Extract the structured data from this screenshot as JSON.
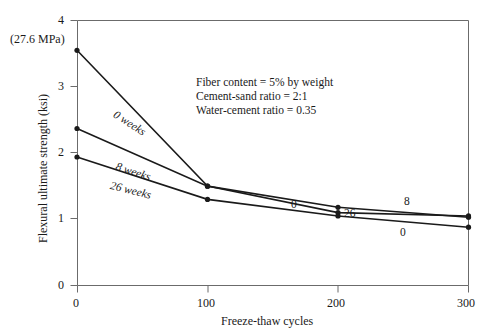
{
  "figure": {
    "background": "#ffffff",
    "line_color": "#1a1a1a",
    "axis_color": "#6b6b6b"
  },
  "annotations": {
    "mpa_note": "(27.6 MPa)",
    "conditions": [
      "Fiber content = 5% by weight",
      "Cement-sand ratio = 2:1",
      "Water-cement ratio = 0.35"
    ]
  },
  "curve_labels": [
    {
      "text": "0 weeks",
      "x": 118,
      "y": 108,
      "rot": 33
    },
    {
      "text": "8 weeks",
      "x": 118,
      "y": 160,
      "rot": 18
    },
    {
      "text": "26 weeks",
      "x": 112,
      "y": 179,
      "rot": 14
    }
  ],
  "end_labels": [
    {
      "text": "0",
      "x": 291,
      "y": 198
    },
    {
      "text": "26",
      "x": 344,
      "y": 207
    },
    {
      "text": "8",
      "x": 404,
      "y": 195
    },
    {
      "text": "0",
      "x": 400,
      "y": 226
    }
  ],
  "chart_data": {
    "type": "line",
    "title": "",
    "xlabel": "Freeze-thaw cycles",
    "ylabel": "Flexural ultimate strength (ksi)",
    "xlim": [
      0,
      300
    ],
    "ylim": [
      0,
      4
    ],
    "xticks": [
      0,
      100,
      200,
      300
    ],
    "yticks": [
      0,
      1,
      2,
      3,
      4
    ],
    "xtick_labels": [
      "0",
      "100",
      "200",
      "300"
    ],
    "ytick_labels": [
      "0",
      "1",
      "2",
      "3",
      "4"
    ],
    "grid": false,
    "legend": "inline-curve-labels",
    "x": [
      0,
      100,
      200,
      300
    ],
    "series": [
      {
        "name": "0 weeks",
        "values": [
          3.55,
          1.5,
          1.1,
          1.05
        ],
        "marker": "dot"
      },
      {
        "name": "8 weeks",
        "values": [
          2.37,
          1.5,
          1.18,
          1.03
        ],
        "marker": "dot"
      },
      {
        "name": "26 weeks",
        "values": [
          1.94,
          1.3,
          1.05,
          0.88
        ],
        "marker": "dot"
      }
    ],
    "annotations": [
      "Fiber content = 5% by weight",
      "Cement-sand ratio = 2:1",
      "Water-cement ratio = 0.35",
      "(27.6 MPa)"
    ]
  }
}
